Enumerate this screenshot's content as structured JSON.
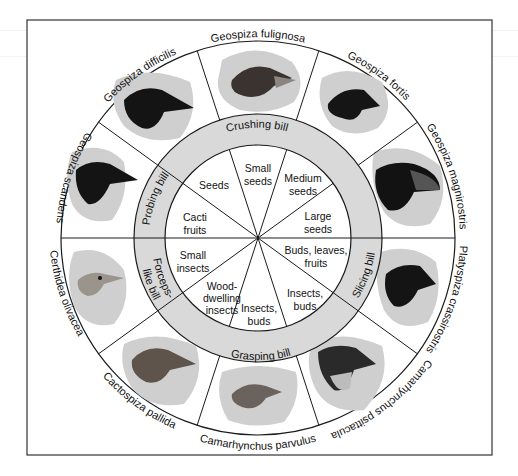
{
  "colors": {
    "line": "#1a1a1a",
    "band": "#d9d9d9",
    "blob": "#cfcfcf",
    "background": "#ffffff"
  },
  "species": [
    {
      "name": "Geospiza fulignosa",
      "head": "dark-brown"
    },
    {
      "name": "Geospiza fortis",
      "head": "black"
    },
    {
      "name": "Geospiza magnirostris",
      "head": "black"
    },
    {
      "name": "Platyspiza crassirostris",
      "head": "black"
    },
    {
      "name": "Camarhynchus psittacula",
      "head": "dark-brown"
    },
    {
      "name": "Camarhynchus parvulus",
      "head": "brown-streaked"
    },
    {
      "name": "Cactospiza pallida",
      "head": "brown"
    },
    {
      "name": "Certhidea olivacea",
      "head": "pale-olive"
    },
    {
      "name": "Geospiza scandens",
      "head": "black"
    },
    {
      "name": "Geospiza difficilis",
      "head": "black"
    }
  ],
  "bill_types": [
    {
      "name": "Crushing bill"
    },
    {
      "name": "Slicing bill"
    },
    {
      "name": "Grasping bill"
    },
    {
      "name": "Forceps-like bill",
      "lines": [
        "Forceps-",
        "like bill"
      ]
    },
    {
      "name": "Probing bill"
    }
  ],
  "diets": [
    {
      "lines": [
        "Small",
        "seeds"
      ]
    },
    {
      "lines": [
        "Medium",
        "seeds"
      ]
    },
    {
      "lines": [
        "Large",
        "seeds"
      ]
    },
    {
      "lines": [
        "Buds, leaves,",
        "fruits"
      ]
    },
    {
      "lines": [
        "Insects,",
        "buds"
      ]
    },
    {
      "lines": [
        "Insects,",
        "buds"
      ]
    },
    {
      "lines": [
        "Wood-",
        "dwelling",
        "insects"
      ]
    },
    {
      "lines": [
        "Small",
        "insects"
      ]
    },
    {
      "lines": [
        "Cacti",
        "fruits"
      ]
    },
    {
      "lines": [
        "Seeds"
      ]
    }
  ]
}
